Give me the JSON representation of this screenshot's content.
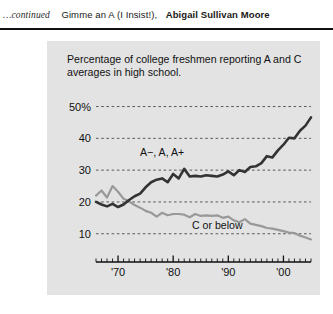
{
  "header": {
    "continued": "…continued",
    "article_title": "Gimme an A (I Insist!),",
    "author": "Abigail Sullivan Moore"
  },
  "chart_data": {
    "type": "line",
    "title": "Percentage of college freshmen reporting A and C averages in high school.",
    "xlabel": "",
    "ylabel": "",
    "xlim": [
      1966,
      2005
    ],
    "ylim": [
      3,
      53
    ],
    "grid": true,
    "gridlines": [
      10,
      20,
      30,
      40,
      50
    ],
    "ytick_labels": [
      "50%",
      "40",
      "30",
      "20",
      "10"
    ],
    "ytick_values": [
      50,
      40,
      30,
      20,
      10
    ],
    "xtick_labels": [
      "'70",
      "'80",
      "'90",
      "'00"
    ],
    "xtick_values": [
      1970,
      1980,
      1990,
      2000
    ],
    "minor_tick_interval": 1,
    "legend_position": "inline-annotation",
    "annotations": [
      {
        "text": "A−, A, A+",
        "x": 1978,
        "y": 34.5
      },
      {
        "text": "C or below",
        "x": 1988,
        "y": 11.5
      }
    ],
    "series": [
      {
        "name": "A−, A, A+",
        "color": "#333333",
        "x": [
          1966,
          1967,
          1968,
          1969,
          1970,
          1971,
          1972,
          1973,
          1974,
          1975,
          1976,
          1977,
          1978,
          1979,
          1980,
          1981,
          1982,
          1983,
          1984,
          1985,
          1986,
          1987,
          1988,
          1989,
          1990,
          1991,
          1992,
          1993,
          1994,
          1995,
          1996,
          1997,
          1998,
          1999,
          2000,
          2001,
          2002,
          2003,
          2004,
          2005
        ],
        "values": [
          20.0,
          19.2,
          18.6,
          19.4,
          18.4,
          19.2,
          20.6,
          21.8,
          22.6,
          24.6,
          26.2,
          27.0,
          27.4,
          26.2,
          28.8,
          27.4,
          30.4,
          28.0,
          28.2,
          28.0,
          28.4,
          28.2,
          28.0,
          28.6,
          29.6,
          28.4,
          30.0,
          29.4,
          31.0,
          31.2,
          32.2,
          34.4,
          34.0,
          36.2,
          38.0,
          40.2,
          40.0,
          42.4,
          44.0,
          46.6
        ]
      },
      {
        "name": "C or below",
        "color": "#999999",
        "x": [
          1966,
          1967,
          1968,
          1969,
          1970,
          1971,
          1972,
          1973,
          1974,
          1975,
          1976,
          1977,
          1978,
          1979,
          1980,
          1981,
          1982,
          1983,
          1984,
          1985,
          1986,
          1987,
          1988,
          1989,
          1990,
          1991,
          1992,
          1993,
          1994,
          1995,
          1996,
          1997,
          1998,
          1999,
          2000,
          2001,
          2002,
          2003,
          2004,
          2005
        ],
        "values": [
          22.0,
          23.6,
          21.4,
          25.0,
          23.2,
          21.0,
          20.2,
          19.0,
          18.2,
          17.2,
          16.6,
          15.4,
          16.6,
          15.8,
          16.2,
          16.2,
          16.0,
          15.2,
          16.2,
          15.6,
          15.8,
          15.6,
          15.8,
          15.0,
          15.4,
          14.2,
          13.6,
          14.6,
          13.2,
          12.8,
          12.4,
          11.8,
          11.6,
          11.2,
          10.8,
          10.4,
          10.2,
          9.4,
          8.8,
          8.2
        ]
      }
    ]
  }
}
